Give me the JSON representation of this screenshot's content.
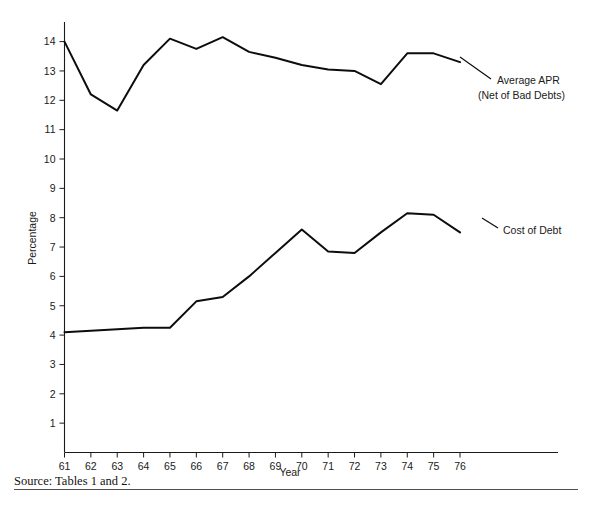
{
  "chart_data": {
    "type": "line",
    "title": "",
    "xlabel": "Year",
    "ylabel": "Percentage",
    "xlim": [
      61,
      76
    ],
    "ylim": [
      0,
      14.5
    ],
    "grid": false,
    "legend_position": "inline-right-annotations",
    "x": [
      61,
      62,
      63,
      64,
      65,
      66,
      67,
      68,
      69,
      70,
      71,
      72,
      73,
      74,
      75,
      76
    ],
    "xticklabels": [
      "61",
      "62",
      "63",
      "64",
      "65",
      "66",
      "67",
      "68",
      "69",
      "70",
      "71",
      "72",
      "73",
      "74",
      "75",
      "76"
    ],
    "yticks": [
      1,
      2,
      3,
      4,
      5,
      6,
      7,
      8,
      9,
      10,
      11,
      12,
      13,
      14
    ],
    "yticklabels": [
      "1",
      "2",
      "3",
      "4",
      "5",
      "6",
      "7",
      "8",
      "9",
      "10",
      "11",
      "12",
      "13",
      "14"
    ],
    "series": [
      {
        "name": "Average APR (Net of Bad Debts)",
        "values": [
          14.0,
          12.2,
          11.65,
          13.2,
          14.1,
          13.75,
          14.15,
          13.65,
          13.45,
          13.2,
          13.05,
          13.0,
          12.55,
          13.6,
          13.6,
          13.3
        ],
        "color": "#0d0d0d"
      },
      {
        "name": "Cost of Debt",
        "values": [
          4.1,
          4.15,
          4.2,
          4.25,
          4.25,
          5.15,
          5.3,
          6.0,
          6.8,
          7.6,
          6.85,
          6.8,
          7.5,
          8.15,
          8.1,
          7.5
        ],
        "color": "#0d0d0d"
      }
    ]
  },
  "annotations": {
    "apr_label_line1": "Average APR",
    "apr_label_line2": "(Net of Bad Debts)",
    "cost_label": "Cost of Debt"
  },
  "axes": {
    "y_axis_title": "Percentage",
    "x_axis_title": "Year"
  },
  "footer": {
    "source": "Source:  Tables 1 and 2."
  }
}
